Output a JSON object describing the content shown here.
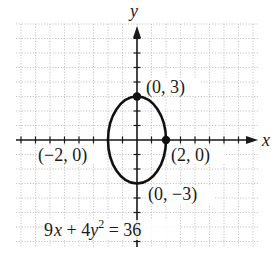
{
  "figure": {
    "type": "ellipse-graph",
    "axes": {
      "x_label": "x",
      "y_label": "y"
    },
    "grid": {
      "spacing_units": 1,
      "x_range": [
        -8,
        8
      ],
      "y_range": [
        -7,
        8
      ]
    },
    "ellipse": {
      "center": [
        0,
        0
      ],
      "semi_axis_x": 2,
      "semi_axis_y": 3
    },
    "points": [
      {
        "label": "(0, 3)",
        "x": 0,
        "y": 3,
        "marked": true
      },
      {
        "label": "(2, 0)",
        "x": 2,
        "y": 0,
        "marked": true
      },
      {
        "label": "(−2, 0)",
        "x": -2,
        "y": 0,
        "marked": false
      },
      {
        "label": "(0, −3)",
        "x": 0,
        "y": -3,
        "marked": false
      }
    ],
    "equation": {
      "lhs_a": "9",
      "var_x": "x",
      "plus": " + 4",
      "var_y": "y",
      "exp": "2",
      "rhs": " = 36"
    },
    "colors": {
      "curve": "#111111",
      "grid": "#b5b5b5",
      "axis": "#1a1a1a"
    }
  }
}
